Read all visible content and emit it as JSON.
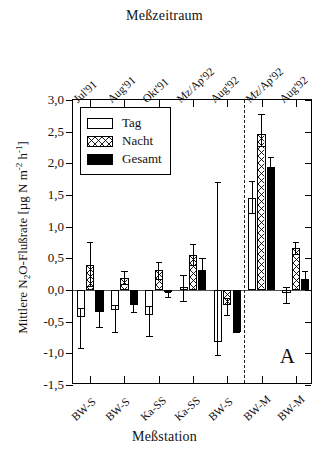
{
  "titles": {
    "top": "Meßzeitraum",
    "bottom": "Meßstation",
    "yaxis": "Mittlere N2O-Flußrate [µg N m-2 h-1]",
    "panel_letter": "A"
  },
  "legend": {
    "items": [
      {
        "label": "Tag",
        "fill": "open"
      },
      {
        "label": "Nacht",
        "fill": "crosshatch"
      },
      {
        "label": "Gesamt",
        "fill": "solid"
      }
    ]
  },
  "chart_data": {
    "type": "bar",
    "title": "Meßzeitraum",
    "xlabel": "Meßstation",
    "ylabel": "Mittlere N2O-Flußrate [µg N m-2 h-1]",
    "ylim": [
      -1.5,
      3.0
    ],
    "yticks": [
      3.0,
      2.5,
      2.0,
      1.5,
      1.0,
      0.5,
      0.0,
      -0.5,
      -1.0,
      -1.5
    ],
    "ytick_labels": [
      "3,0",
      "2,5",
      "2,0",
      "1,5",
      "1,0",
      "0,5",
      "0,0",
      "-0,5",
      "-1,0",
      "-1,5"
    ],
    "grid": false,
    "legend_position": "top-left",
    "top_axis_label": "Meßzeitraum",
    "top_categories": [
      "Jul'91",
      "Aug'91",
      "Okt'91",
      "Mz/Ap'92",
      "Aug'92",
      "Mz/Ap'92",
      "Aug'92"
    ],
    "categories": [
      "BW-S",
      "BW-S",
      "Ka-SS",
      "Ka-SS",
      "BW-S",
      "BW-M",
      "BW-M"
    ],
    "series": [
      {
        "name": "Tag",
        "values": [
          -0.42,
          -0.32,
          -0.4,
          0.05,
          -0.82,
          1.46,
          -0.05
        ],
        "err_low": [
          -0.92,
          -0.67,
          -0.73,
          -0.17,
          -1.02,
          1.22,
          -0.2
        ],
        "err_high": [
          -0.28,
          -0.23,
          -0.26,
          0.23,
          1.7,
          1.72,
          0.05
        ]
      },
      {
        "name": "Nacht",
        "values": [
          0.4,
          0.19,
          0.31,
          0.55,
          -0.24,
          2.47,
          0.66
        ],
        "err_low": [
          0.07,
          0.1,
          0.17,
          0.39,
          -0.4,
          2.27,
          0.57
        ],
        "err_high": [
          0.76,
          0.3,
          0.45,
          0.73,
          -0.13,
          2.78,
          0.76
        ]
      },
      {
        "name": "Gesamt",
        "values": [
          -0.35,
          -0.23,
          -0.03,
          0.32,
          -0.67,
          1.95,
          0.17
        ],
        "err_low": [
          -0.59,
          -0.35,
          -0.11,
          0.32,
          -0.67,
          1.95,
          0.17
        ],
        "err_high": [
          -0.1,
          -0.1,
          -0.03,
          0.5,
          -0.42,
          2.1,
          0.3
        ]
      }
    ],
    "divider_after_category_index": 4
  }
}
